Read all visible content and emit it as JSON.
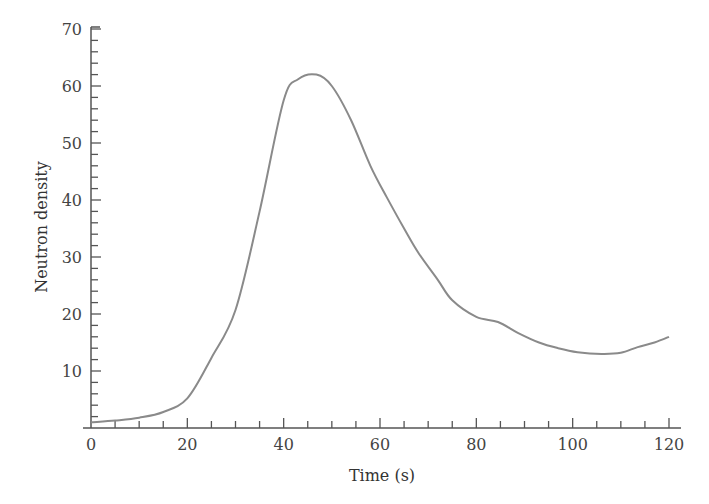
{
  "chart_data": {
    "type": "line",
    "title": "",
    "xlabel": "Time (s)",
    "ylabel": "Neutron density",
    "xlim": [
      0,
      120
    ],
    "ylim": [
      0,
      70
    ],
    "x_ticks": [
      0,
      20,
      40,
      60,
      80,
      100,
      120
    ],
    "x_minor_step": 5,
    "y_ticks": [
      10,
      20,
      30,
      40,
      50,
      60,
      70
    ],
    "y_minor_step": 2,
    "grid": false,
    "legend": null,
    "series": [
      {
        "name": "Neutron density",
        "color": "#8a8a8a",
        "x": [
          0,
          5,
          10,
          15,
          20,
          25,
          30,
          35,
          40,
          43,
          46.8,
          50,
          54,
          58,
          61.4,
          65,
          68,
          72,
          75,
          80,
          84.5,
          88.6,
          93,
          97,
          101,
          106,
          110,
          113.5,
          117,
          120
        ],
        "y": [
          1.0,
          1.3,
          1.8,
          2.8,
          5.2,
          12.3,
          20.7,
          38,
          57.5,
          61.2,
          62,
          60,
          54,
          46,
          40.5,
          35,
          30.7,
          26,
          22.4,
          19.5,
          18.6,
          16.7,
          15,
          14,
          13.3,
          13,
          13.2,
          14.2,
          15,
          16
        ]
      }
    ]
  }
}
